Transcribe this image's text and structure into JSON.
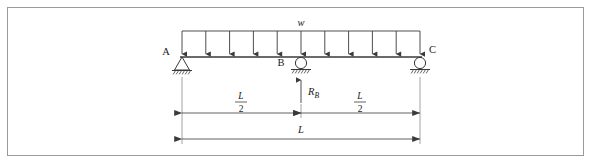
{
  "figure": {
    "type": "beam-free-body-diagram",
    "border_color": "#9a9a9a",
    "line_color": "#3a3a3a",
    "text_color": "#1a1a1a",
    "background": "#ffffff"
  },
  "load": {
    "symbol": "w",
    "kind": "uniformly-distributed-load",
    "arrow_count": 11,
    "direction": "downward"
  },
  "beam": {
    "left_x": 182,
    "right_x": 420,
    "y": 57,
    "span_label": "L"
  },
  "supports": [
    {
      "id": "A",
      "label": "A",
      "kind": "pin",
      "x": 182,
      "label_x": 166,
      "label_y": 55
    },
    {
      "id": "B",
      "label": "B",
      "kind": "roller",
      "x": 301,
      "label_x": 281,
      "label_y": 64
    },
    {
      "id": "C",
      "label": "C",
      "kind": "roller",
      "x": 420,
      "label_x": 428,
      "label_y": 51
    }
  ],
  "reactions": [
    {
      "id": "R_B",
      "base": "R",
      "subscript": "B",
      "at_support": "B",
      "direction": "upward",
      "label_x": 308,
      "label_y": 93
    }
  ],
  "dimensions": [
    {
      "id": "left-half",
      "label_base": "L",
      "label_denominator": "2",
      "kind": "fraction",
      "from_x": 182,
      "to_x": 301,
      "y": 113,
      "label_x": 241,
      "label_y": 99
    },
    {
      "id": "right-half",
      "label_base": "L",
      "label_denominator": "2",
      "kind": "fraction",
      "from_x": 301,
      "to_x": 420,
      "y": 113,
      "label_x": 360,
      "label_y": 99
    },
    {
      "id": "total-span",
      "label_base": "L",
      "kind": "plain",
      "from_x": 182,
      "to_x": 420,
      "y": 139,
      "label_x": 301,
      "label_y": 131
    }
  ]
}
